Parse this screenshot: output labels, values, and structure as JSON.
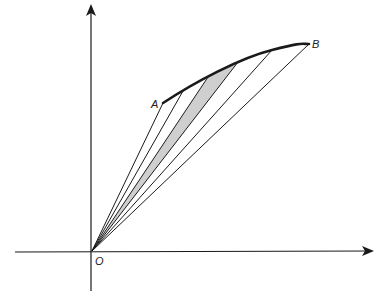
{
  "diagram": {
    "labels": {
      "origin": "O",
      "start_point": "A",
      "end_point": "B"
    },
    "colors": {
      "stroke": "#1a1a1a",
      "shade": "#cfcfcf",
      "background": "#ffffff"
    },
    "points": {
      "O": [
        92,
        251
      ],
      "A": [
        163,
        103
      ],
      "P1": [
        183,
        91
      ],
      "P2": [
        208,
        77
      ],
      "P3": [
        238,
        62
      ],
      "P4": [
        272,
        50
      ],
      "B": [
        309,
        44
      ]
    },
    "shaded_sector": [
      "O",
      "P2",
      "P3"
    ]
  }
}
